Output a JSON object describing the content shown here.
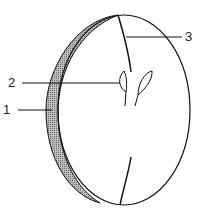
{
  "diagram": {
    "labels": [
      {
        "id": "1",
        "text": "1",
        "x": 3,
        "y": 103
      },
      {
        "id": "2",
        "text": "2",
        "x": 8,
        "y": 77
      },
      {
        "id": "3",
        "text": "3",
        "x": 184,
        "y": 30
      }
    ],
    "colors": {
      "stroke": "#111111",
      "shading": "#9a9a9a",
      "background": "#ffffff"
    }
  }
}
